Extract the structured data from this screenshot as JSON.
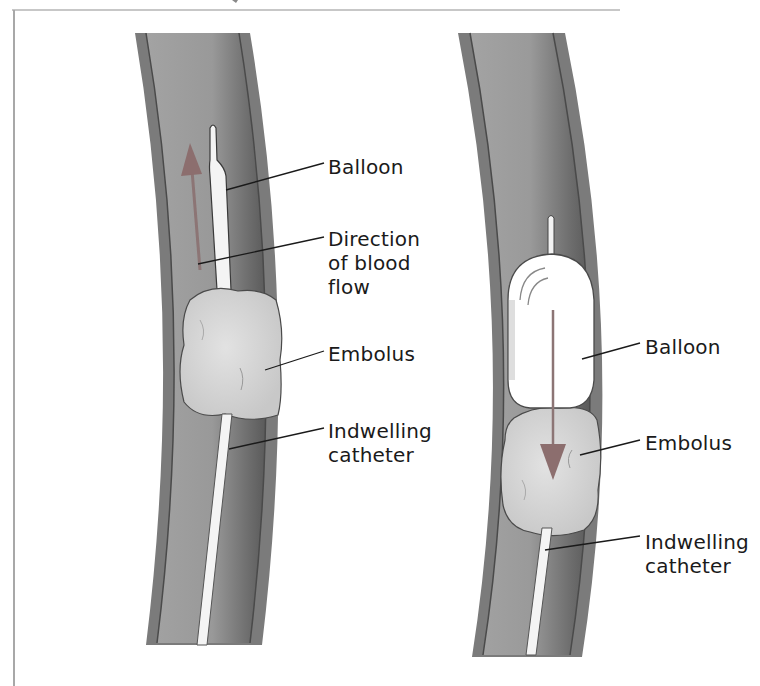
{
  "figure": {
    "panels": [
      {
        "id": "before",
        "description": "Deflated balloon catheter passed beyond embolus",
        "labels": [
          {
            "text": "Balloon",
            "x": 328,
            "y": 155
          },
          {
            "text": "Direction\nof blood\nflow",
            "x": 328,
            "y": 227
          },
          {
            "text": "Embolus",
            "x": 328,
            "y": 342
          },
          {
            "text": "Indwelling\ncatheter",
            "x": 328,
            "y": 419
          }
        ]
      },
      {
        "id": "after",
        "description": "Inflated balloon withdrawn, pulling embolus",
        "labels": [
          {
            "text": "Balloon",
            "x": 645,
            "y": 335
          },
          {
            "text": "Embolus",
            "x": 645,
            "y": 431
          },
          {
            "text": "Indwelling\ncatheter",
            "x": 645,
            "y": 530
          }
        ]
      }
    ],
    "colors": {
      "vessel_wall": "#7a7a7a",
      "vessel_lumen": "#9a9a9a",
      "embolus": "#d9d9d9",
      "balloon": "#ffffff",
      "arrow": "#8c6e6e",
      "leader_line": "#1a1a1a",
      "frame": "#b0b0b0"
    }
  }
}
